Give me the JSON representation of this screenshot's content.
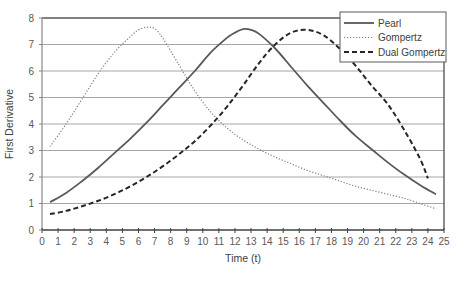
{
  "chart_data": {
    "type": "line",
    "title": "",
    "xlabel": "Time (t)",
    "ylabel": "First Derivative",
    "xlim": [
      0,
      25
    ],
    "ylim": [
      0,
      8
    ],
    "x_ticks": [
      0,
      1,
      2,
      3,
      4,
      5,
      6,
      7,
      8,
      9,
      10,
      11,
      12,
      13,
      14,
      15,
      16,
      17,
      18,
      19,
      20,
      21,
      22,
      23,
      24,
      25
    ],
    "y_ticks": [
      0,
      1,
      2,
      3,
      4,
      5,
      6,
      7,
      8
    ],
    "grid": "horizontal",
    "legend_position": "top-right",
    "series": [
      {
        "name": "Pearl",
        "style": "solid",
        "color": "#595959",
        "x": [
          0.5,
          1.5,
          2.5,
          3.5,
          4.5,
          5.5,
          6.5,
          7.5,
          8.5,
          9.5,
          10.5,
          11.5,
          12.0,
          12.5,
          13.0,
          13.5,
          14.5,
          15.5,
          16.5,
          17.5,
          18.5,
          19.5,
          20.5,
          21.5,
          22.5,
          23.5,
          24.5
        ],
        "y": [
          1.05,
          1.4,
          1.85,
          2.35,
          2.9,
          3.45,
          4.05,
          4.7,
          5.35,
          6.0,
          6.7,
          7.25,
          7.45,
          7.58,
          7.55,
          7.4,
          6.85,
          6.15,
          5.45,
          4.8,
          4.15,
          3.55,
          3.05,
          2.55,
          2.1,
          1.7,
          1.35
        ]
      },
      {
        "name": "Gompertz",
        "style": "dotted",
        "color": "#7f7f7f",
        "x": [
          0.5,
          1.5,
          2.5,
          3.5,
          4.5,
          5.5,
          6.0,
          6.5,
          7.0,
          7.5,
          8.5,
          9.5,
          10.5,
          11.5,
          12.5,
          13.5,
          14.5,
          15.5,
          16.5,
          17.5,
          18.5,
          19.5,
          20.5,
          21.5,
          22.5,
          23.5,
          24.5
        ],
        "y": [
          3.15,
          4.0,
          4.95,
          5.9,
          6.7,
          7.3,
          7.55,
          7.65,
          7.6,
          7.25,
          6.25,
          5.25,
          4.45,
          3.85,
          3.4,
          3.05,
          2.75,
          2.5,
          2.25,
          2.05,
          1.85,
          1.65,
          1.5,
          1.35,
          1.2,
          1.0,
          0.8
        ]
      },
      {
        "name": "Dual Gompertz",
        "style": "dashed",
        "color": "#262626",
        "x": [
          0.5,
          1.5,
          2.5,
          3.5,
          4.5,
          5.5,
          6.5,
          7.5,
          8.5,
          9.5,
          10.5,
          11.5,
          12.5,
          13.5,
          14.5,
          15.5,
          16.5,
          17.5,
          18.5,
          19.5,
          20.5,
          21.5,
          22.5,
          23.5,
          24.0
        ],
        "y": [
          0.6,
          0.72,
          0.9,
          1.1,
          1.35,
          1.65,
          2.0,
          2.4,
          2.85,
          3.35,
          3.95,
          4.65,
          5.45,
          6.3,
          7.0,
          7.45,
          7.55,
          7.35,
          6.85,
          6.2,
          5.45,
          4.75,
          3.8,
          2.7,
          1.95
        ]
      }
    ]
  }
}
